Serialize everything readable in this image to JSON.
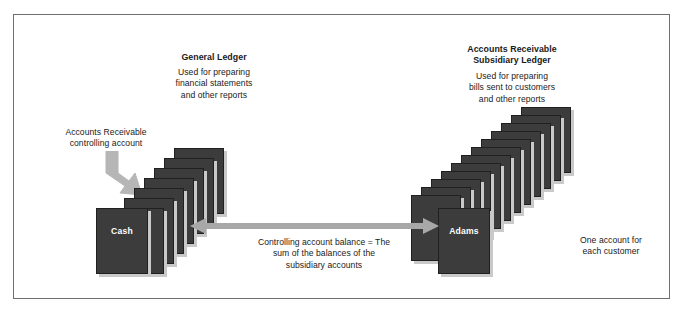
{
  "diagram": {
    "general_ledger": {
      "title": "General Ledger",
      "description": "Used for preparing\nfinancial statements\nand other reports",
      "front_card_label": "Cash",
      "card_count": 8
    },
    "subsidiary_ledger": {
      "title": "Accounts Receivable\nSubsidiary Ledger",
      "description": "Used for preparing\nbills sent to customers\nand other reports",
      "front_card_label": "Adams",
      "card_count": 13,
      "side_note": "One account for\neach customer"
    },
    "callout": {
      "controlling_account": "Accounts Receivable\ncontrolling account"
    },
    "relationship": {
      "balance_equation": "Controlling account balance = The\nsum of the balances of the\nsubsidiary accounts"
    },
    "colors": {
      "card_fill": "#3c3c3c",
      "card_border": "#202020",
      "card_shadow": "#c9c9c9",
      "arrow": "#a8a8a8",
      "frame_border": "#6d6f72",
      "background": "#ffffff",
      "text": "#1a1a1a",
      "card_text": "#ffffff"
    }
  }
}
